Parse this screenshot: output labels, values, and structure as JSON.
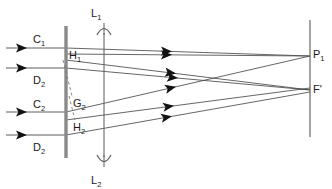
{
  "diagram": {
    "type": "optics-ray-diagram",
    "canvas": {
      "width": 332,
      "height": 189,
      "background": "#ffffff"
    },
    "colors": {
      "ray": "#4a4a4a",
      "stop": "#8a8a8a",
      "axis": "#5a5a5a",
      "dashed": "#7a7a7a",
      "label": "#1a1a1a",
      "arrowhead": "#111111"
    },
    "labels": [
      {
        "id": "C1",
        "base": "C",
        "sub": "1",
        "x": 33,
        "y": 43
      },
      {
        "id": "H1",
        "base": "H",
        "sub": "1",
        "x": 69,
        "y": 59
      },
      {
        "id": "D2top",
        "base": "D",
        "sub": "2",
        "x": 33,
        "y": 84
      },
      {
        "id": "C2",
        "base": "C",
        "sub": "2",
        "x": 33,
        "y": 108
      },
      {
        "id": "G2",
        "base": "G",
        "sub": "2",
        "x": 73,
        "y": 107
      },
      {
        "id": "H2",
        "base": "H",
        "sub": "2",
        "x": 73,
        "y": 131
      },
      {
        "id": "D2bot",
        "base": "D",
        "sub": "2",
        "x": 33,
        "y": 151
      },
      {
        "id": "L1",
        "base": "L",
        "sub": "1",
        "x": 91,
        "y": 17
      },
      {
        "id": "L2",
        "base": "L",
        "sub": "2",
        "x": 91,
        "y": 184
      },
      {
        "id": "P1",
        "base": "P",
        "sub": "1",
        "x": 313,
        "y": 58
      },
      {
        "id": "Fprime",
        "base": "F'",
        "sub": "",
        "x": 313,
        "y": 93
      }
    ],
    "lens_axis": {
      "x": 104,
      "y_top": 33,
      "y_bottom": 157
    },
    "lens_arrow_top": {
      "label_ref": "L1",
      "tip_y": 22
    },
    "lens_arrow_bottom": {
      "label_ref": "L2",
      "tip_y": 168
    },
    "stop_bars": [
      {
        "id": "stop-upper",
        "x": 66,
        "y_top": 26,
        "y_bottom": 67
      },
      {
        "id": "stop-mid",
        "x": 66,
        "y_top": 67,
        "y_bottom": 113
      },
      {
        "id": "stop-lower",
        "x": 66,
        "y_top": 113,
        "y_bottom": 158
      }
    ],
    "image_plane": {
      "x": 310,
      "y_top": 20,
      "y_bottom": 137
    },
    "incoming_rays": [
      {
        "id": "ray-in-1",
        "y": 48,
        "x_start": 6,
        "x_end": 66,
        "arrow_x": 27
      },
      {
        "id": "ray-in-2",
        "y": 68,
        "x_start": 6,
        "x_end": 66,
        "arrow_x": 27
      },
      {
        "id": "ray-in-3",
        "y": 112,
        "x_start": 6,
        "x_end": 66,
        "arrow_x": 27
      },
      {
        "id": "ray-in-4",
        "y": 135,
        "x_start": 6,
        "x_end": 66,
        "arrow_x": 27
      }
    ],
    "traced_rays": [
      {
        "id": "ray-a",
        "x1": 66,
        "y1": 48,
        "x2": 310,
        "y2": 56,
        "arrow_x": 172,
        "note": "upper axial to P1"
      },
      {
        "id": "ray-b",
        "x1": 66,
        "y1": 54,
        "x2": 310,
        "y2": 56,
        "arrow_x": 172,
        "note": "H1 edge to P1"
      },
      {
        "id": "ray-c",
        "x1": 66,
        "y1": 60,
        "x2": 310,
        "y2": 90,
        "arrow_x": 176,
        "note": "H1 lower to F'"
      },
      {
        "id": "ray-d",
        "x1": 66,
        "y1": 68,
        "x2": 310,
        "y2": 90,
        "arrow_x": 178,
        "note": "D2 upper to F'"
      },
      {
        "id": "ray-e",
        "x1": 66,
        "y1": 112,
        "x2": 310,
        "y2": 56,
        "arrow_x": 176,
        "note": "C2 to P1"
      },
      {
        "id": "ray-f",
        "x1": 66,
        "y1": 120,
        "x2": 310,
        "y2": 88,
        "arrow_x": 174,
        "note": "H2 to F'"
      },
      {
        "id": "ray-g",
        "x1": 66,
        "y1": 135,
        "x2": 310,
        "y2": 92,
        "arrow_x": 172,
        "note": "D2 lower to F'"
      }
    ],
    "dashed_segments": [
      {
        "id": "dash-upper",
        "x1": 63,
        "y1": 60,
        "x2": 72,
        "y2": 96
      },
      {
        "id": "dash-lower",
        "x1": 69,
        "y1": 96,
        "x2": 75,
        "y2": 120
      }
    ]
  }
}
